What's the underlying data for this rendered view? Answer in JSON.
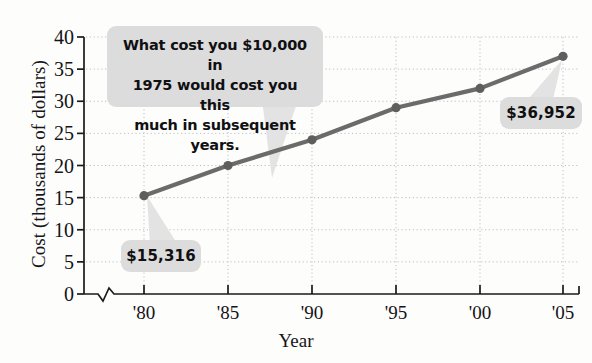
{
  "chart_data": {
    "type": "line",
    "title": "",
    "xlabel": "Year",
    "ylabel": "Cost (thousands of dollars)",
    "categories": [
      "'80",
      "'85",
      "'90",
      "'95",
      "'00",
      "'05"
    ],
    "values": [
      15.3,
      20.0,
      24.0,
      29.0,
      32.0,
      37.0
    ],
    "series": [
      {
        "name": "Cost",
        "values": [
          15.3,
          20.0,
          24.0,
          29.0,
          32.0,
          37.0
        ]
      }
    ],
    "ylim": [
      0,
      40
    ],
    "y_ticks": [
      0,
      5,
      10,
      15,
      20,
      25,
      30,
      35,
      40
    ],
    "y_tick_labels": [
      "0",
      "5",
      "10",
      "15",
      "20",
      "25",
      "30",
      "35",
      "40"
    ],
    "grid": true,
    "legend": "none",
    "axis_break": true,
    "line_color": "#6b6b6b",
    "marker_color": "#5e5e5e",
    "grid_color": "#b9bfcc",
    "annotations": [
      {
        "name": "main-callout",
        "text": "What cost you $10,000 in 1975 would cost you this much in subsequent years.",
        "lines": [
          "What cost you $10,000 in",
          "1975 would cost you this",
          "much in subsequent years."
        ]
      },
      {
        "name": "value-label-1980",
        "text": "$15,316",
        "points_to": "'80"
      },
      {
        "name": "value-label-2005",
        "text": "$36,952",
        "points_to": "'05"
      }
    ]
  },
  "axes": {
    "y_title": "Cost (thousands of dollars)",
    "x_title": "Year"
  },
  "labels": {
    "callout_line_1": "What cost you $10,000 in",
    "callout_line_2": "1975 would cost you this",
    "callout_line_3": "much in subsequent years.",
    "value_1980": "$15,316",
    "value_2005": "$36,952"
  },
  "colors": {
    "line": "#6b6b6b",
    "marker": "#5e5e5e",
    "callout_bg": "#dcdcdc",
    "grid": "#b9bfcc",
    "axis": "#1b1a1e",
    "text": "#141317"
  }
}
